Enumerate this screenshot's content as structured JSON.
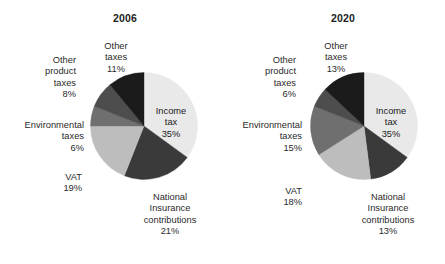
{
  "figure": {
    "background": "#ffffff",
    "text_color": "#2a2a2a"
  },
  "chart_data": [
    {
      "type": "pie",
      "title": "2006",
      "xlabel": "",
      "ylabel": "",
      "legend_position": "none",
      "grid": false,
      "start_angle_deg": 0,
      "direction": "clockwise",
      "categories": [
        "Income tax",
        "National Insurance contributions",
        "VAT",
        "Environmental taxes",
        "Other product taxes",
        "Other taxes"
      ],
      "values": [
        35,
        21,
        19,
        6,
        8,
        11
      ],
      "value_unit": "%",
      "colors": [
        "#e9e9e9",
        "#3a3a3a",
        "#bdbdbd",
        "#6f6f6f",
        "#4d4d4d",
        "#1b1b1b"
      ],
      "slices": [
        {
          "label": "Income tax",
          "label_lines": [
            "Income",
            "tax"
          ],
          "pct": "35%",
          "value": 35,
          "color": "#e9e9e9",
          "label_inside": true
        },
        {
          "label": "National Insurance contributions",
          "label_lines": [
            "National",
            "Insurance",
            "contributions"
          ],
          "pct": "21%",
          "value": 21,
          "color": "#3a3a3a",
          "label_inside": false
        },
        {
          "label": "VAT",
          "label_lines": [
            "VAT"
          ],
          "pct": "19%",
          "value": 19,
          "color": "#bdbdbd",
          "label_inside": false
        },
        {
          "label": "Environmental taxes",
          "label_lines": [
            "Environmental",
            "taxes"
          ],
          "pct": "6%",
          "value": 6,
          "color": "#6f6f6f",
          "label_inside": false
        },
        {
          "label": "Other product taxes",
          "label_lines": [
            "Other",
            "product",
            "taxes"
          ],
          "pct": "8%",
          "value": 8,
          "color": "#4d4d4d",
          "label_inside": false
        },
        {
          "label": "Other taxes",
          "label_lines": [
            "Other",
            "taxes"
          ],
          "pct": "11%",
          "value": 11,
          "color": "#1b1b1b",
          "label_inside": false
        }
      ]
    },
    {
      "type": "pie",
      "title": "2020",
      "xlabel": "",
      "ylabel": "",
      "legend_position": "none",
      "grid": false,
      "start_angle_deg": 0,
      "direction": "clockwise",
      "categories": [
        "Income tax",
        "National Insurance contributions",
        "VAT",
        "Environmental taxes",
        "Other product taxes",
        "Other taxes"
      ],
      "values": [
        35,
        13,
        18,
        15,
        6,
        13
      ],
      "value_unit": "%",
      "colors": [
        "#e9e9e9",
        "#3a3a3a",
        "#bdbdbd",
        "#6f6f6f",
        "#4d4d4d",
        "#1b1b1b"
      ],
      "slices": [
        {
          "label": "Income tax",
          "label_lines": [
            "Income",
            "tax"
          ],
          "pct": "35%",
          "value": 35,
          "color": "#e9e9e9",
          "label_inside": true
        },
        {
          "label": "National Insurance contributions",
          "label_lines": [
            "National",
            "Insurance",
            "contributions"
          ],
          "pct": "13%",
          "value": 13,
          "color": "#3a3a3a",
          "label_inside": false
        },
        {
          "label": "VAT",
          "label_lines": [
            "VAT"
          ],
          "pct": "18%",
          "value": 18,
          "color": "#bdbdbd",
          "label_inside": false
        },
        {
          "label": "Environmental taxes",
          "label_lines": [
            "Environmental",
            "taxes"
          ],
          "pct": "15%",
          "value": 15,
          "color": "#6f6f6f",
          "label_inside": false
        },
        {
          "label": "Other product taxes",
          "label_lines": [
            "Other",
            "product",
            "taxes"
          ],
          "pct": "6%",
          "value": 6,
          "color": "#4d4d4d",
          "label_inside": false
        },
        {
          "label": "Other taxes",
          "label_lines": [
            "Other",
            "taxes"
          ],
          "pct": "13%",
          "value": 13,
          "color": "#1b1b1b",
          "label_inside": false
        }
      ]
    }
  ]
}
